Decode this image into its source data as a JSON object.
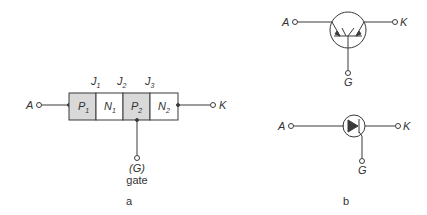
{
  "panel_a": {
    "caption": "a",
    "anode": "A",
    "cathode": "K",
    "layers": [
      {
        "type": "P",
        "sub": "1",
        "shaded": true
      },
      {
        "type": "N",
        "sub": "1",
        "shaded": false
      },
      {
        "type": "P",
        "sub": "2",
        "shaded": true
      },
      {
        "type": "N",
        "sub": "2",
        "shaded": false
      }
    ],
    "junctions": [
      {
        "label": "J",
        "sub": "1"
      },
      {
        "label": "J",
        "sub": "2"
      },
      {
        "label": "J",
        "sub": "3"
      }
    ],
    "gate_symbol": "(G)",
    "gate_text": "gate"
  },
  "panel_b": {
    "caption": "b",
    "top_symbol": {
      "anode": "A",
      "cathode": "K",
      "gate": "G"
    },
    "bottom_symbol": {
      "anode": "A",
      "cathode": "K",
      "gate": "G"
    }
  },
  "colors": {
    "line": "#3a3a3a",
    "shade": "#d9d9d9"
  }
}
